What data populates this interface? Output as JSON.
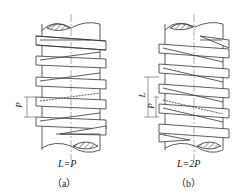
{
  "figure": {
    "panels": [
      {
        "id": "a",
        "formula": "L=P",
        "caption": "（a）",
        "dimensions": [
          "P"
        ],
        "description": "single-start thread"
      },
      {
        "id": "b",
        "formula": "L=2P",
        "caption": "（b）",
        "dimensions": [
          "L",
          "P"
        ],
        "description": "double-start thread"
      }
    ],
    "colors": {
      "line": "#333333",
      "hatch": "#444444",
      "centerline": "#777777",
      "background": "#ffffff"
    }
  }
}
